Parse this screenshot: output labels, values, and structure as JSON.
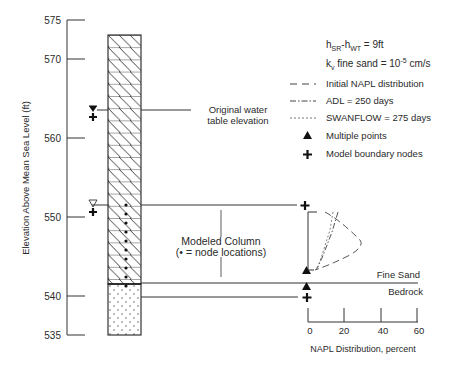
{
  "diagram": {
    "y_axis": {
      "label": "Elevation Above Mean Sea Level (ft)",
      "ticks": [
        "575",
        "570",
        "560",
        "550",
        "540",
        "535"
      ]
    },
    "annotations": {
      "original_water_table_line1": "Original water",
      "original_water_table_line2": "table elevation",
      "modeled_column_line1": "Modeled Column",
      "modeled_column_line2": "(• = node locations)",
      "fine_sand": "Fine Sand",
      "bedrock": "Bedrock"
    },
    "legend": {
      "param1_main": "h",
      "param1_sub1": "SR",
      "param1_mid": "-h",
      "param1_sub2": "WT",
      "param1_value": " = 9ft",
      "param2_main": "k",
      "param2_sub": "v",
      "param2_text": " fine sand = 10",
      "param2_exp": "-5",
      "param2_unit": " cm/s",
      "items": [
        {
          "label": "Initial NAPL distribution",
          "symbol": "long-dash-line"
        },
        {
          "label": "ADL = 250 days",
          "symbol": "dash-dot-line"
        },
        {
          "label": "SWANFLOW = 275 days",
          "symbol": "short-dash-line"
        },
        {
          "label": "Multiple points",
          "symbol": "filled-triangle"
        },
        {
          "label": "Model boundary nodes",
          "symbol": "plus"
        }
      ]
    },
    "x_axis": {
      "label": "NAPL Distribution, percent",
      "ticks": [
        "0",
        "20",
        "40",
        "60"
      ]
    }
  }
}
